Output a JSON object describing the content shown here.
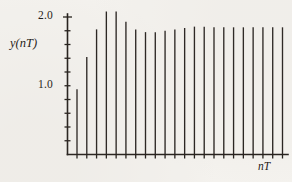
{
  "figure": {
    "background_color": "#f4f2ee",
    "ink_color": "#26211d"
  },
  "axis": {
    "y_label": "y(nT)",
    "x_label": "nT",
    "y_tick_labels": [
      {
        "text": "2.0",
        "value": 2.0
      },
      {
        "text": "1.0",
        "value": 1.0
      }
    ]
  },
  "chart_data": {
    "type": "bar",
    "title": "",
    "subtitle": "",
    "xlabel": "nT",
    "ylabel": "y(nT)",
    "grid": false,
    "legend": null,
    "xlim": [
      0,
      22
    ],
    "ylim": [
      0,
      2.2
    ],
    "y_major_ticks": [
      1.0,
      2.0
    ],
    "y_minor_tick_count": 19,
    "x_tick_count": 22,
    "categories": [
      "1T",
      "2T",
      "3T",
      "4T",
      "5T",
      "6T",
      "7T",
      "8T",
      "9T",
      "10T",
      "11T",
      "12T",
      "13T",
      "14T",
      "15T",
      "16T",
      "17T",
      "18T",
      "19T",
      "20T",
      "21T",
      "22T"
    ],
    "values": [
      0.95,
      1.42,
      1.82,
      2.08,
      2.08,
      1.93,
      1.82,
      1.78,
      1.78,
      1.8,
      1.82,
      1.84,
      1.86,
      1.86,
      1.85,
      1.85,
      1.85,
      1.85,
      1.85,
      1.85,
      1.85,
      1.85
    ],
    "annotations": []
  }
}
